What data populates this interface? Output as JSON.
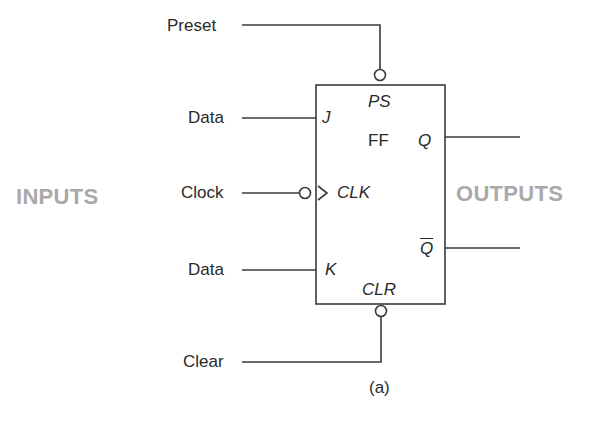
{
  "diagram": {
    "title_caption": "(a)",
    "groups": {
      "inputs": "INPUTS",
      "outputs": "OUTPUTS"
    },
    "block": {
      "name": "FF",
      "preset_pin": "PS",
      "clear_pin": "CLR"
    },
    "inputs": [
      {
        "label": "Preset",
        "pin": "PS",
        "active_low": true
      },
      {
        "label": "Data",
        "pin": "J"
      },
      {
        "label": "Clock",
        "pin": "CLK",
        "active_low": true,
        "edge_triggered": true
      },
      {
        "label": "Data",
        "pin": "K"
      },
      {
        "label": "Clear",
        "pin": "CLR",
        "active_low": true
      }
    ],
    "outputs": [
      {
        "pin": "Q"
      },
      {
        "pin": "Q"
      }
    ],
    "colors": {
      "line": "#3a3a3a",
      "group_label": "#a9a9a9"
    }
  }
}
